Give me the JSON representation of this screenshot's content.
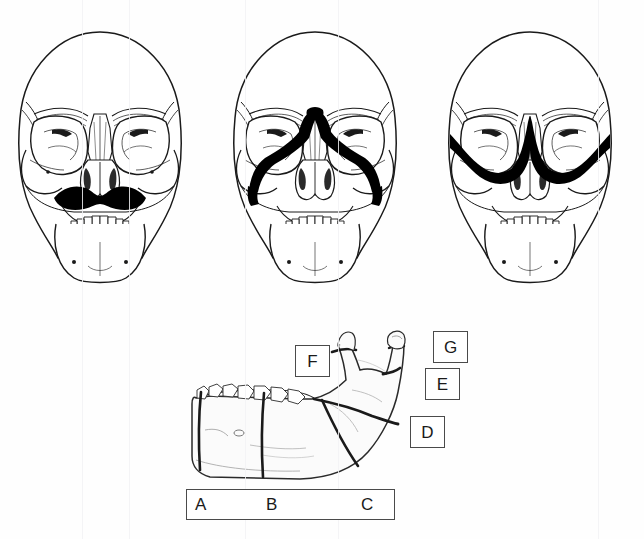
{
  "figure": {
    "background_color": "#ffffff",
    "fracture_ink_color": "#000000",
    "bone_outline_color": "#1a1a1a",
    "label_box_border_color": "#4a4a4a",
    "label_text_color": "#1a1a1a"
  },
  "skulls": [
    {
      "id": "skull-1",
      "name": "le-fort-i-skull",
      "fracture_pattern": "Le Fort I",
      "description": "Horizontal maxillary fracture line above the upper teeth",
      "fracture_marked": true
    },
    {
      "id": "skull-2",
      "name": "le-fort-ii-skull",
      "fracture_pattern": "Le Fort II",
      "description": "Pyramidal fracture crossing nasal bridge, inferior orbital rims and maxilla",
      "fracture_marked": true
    },
    {
      "id": "skull-3",
      "name": "le-fort-iii-skull",
      "fracture_pattern": "Le Fort III",
      "description": "Craniofacial disjunction across both orbits and nasal bridge",
      "fracture_marked": true
    }
  ],
  "mandible": {
    "name": "lateral-mandible",
    "view": "lateral",
    "fracture_lines": 7
  },
  "labels": {
    "boxed": [
      {
        "key": "F",
        "name": "label-box-f",
        "x": 295,
        "y": 345,
        "w": 33,
        "h": 30
      },
      {
        "key": "G",
        "name": "label-box-g",
        "x": 433,
        "y": 331,
        "w": 33,
        "h": 30
      },
      {
        "key": "E",
        "name": "label-box-e",
        "x": 425,
        "y": 368,
        "w": 33,
        "h": 30
      },
      {
        "key": "D",
        "name": "label-box-d",
        "x": 410,
        "y": 416,
        "w": 33,
        "h": 30
      }
    ],
    "bar": {
      "name": "label-bar-abc",
      "x": 186,
      "y": 489,
      "w": 207,
      "h": 29,
      "items": [
        {
          "key": "A",
          "name": "label-a",
          "offset_x": 8
        },
        {
          "key": "B",
          "name": "label-b",
          "offset_x": 79
        },
        {
          "key": "C",
          "name": "label-c",
          "offset_x": 174
        }
      ]
    }
  }
}
